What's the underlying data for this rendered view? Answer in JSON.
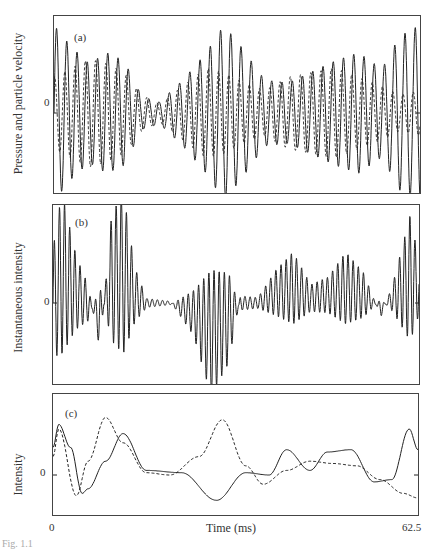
{
  "figure": {
    "panels": [
      {
        "id": "a",
        "tag": "(a)",
        "ylabel": "Pressure and particle velocity",
        "zero_label": "0"
      },
      {
        "id": "b",
        "tag": "(b)",
        "ylabel": "Instantaneous intensity",
        "zero_label": "0"
      },
      {
        "id": "c",
        "tag": "(c)",
        "ylabel": "Intensity",
        "zero_label": "0"
      }
    ],
    "xaxis": {
      "label": "Time (ms)",
      "min_label": "0",
      "max_label": "62.5"
    },
    "caption_fragment": "Fig. 1.1"
  },
  "chart_data": [
    {
      "type": "line",
      "title": "(a)",
      "xlabel": "",
      "ylabel": "Pressure and particle velocity",
      "xlim": [
        0,
        62.5
      ],
      "yticks": [
        "0"
      ],
      "grid": false,
      "series": [
        {
          "name": "pressure",
          "style": "solid",
          "description": "oscillating waveform (~35 cycles over 62.5 ms) with beating amplitude envelope; large excursions near 0-8 ms, 27-33 ms and 57-62 ms, minimum near 15-17 ms"
        },
        {
          "name": "particle velocity",
          "style": "dashed",
          "description": "oscillating waveform of similar frequency, smaller amplitude, out of phase in some segments"
        }
      ]
    },
    {
      "type": "line",
      "title": "(b)",
      "xlabel": "",
      "ylabel": "Instantaneous intensity",
      "xlim": [
        0,
        62.5
      ],
      "yticks": [
        "0"
      ],
      "grid": false,
      "series": [
        {
          "name": "instantaneous intensity",
          "style": "solid",
          "description": "rapid oscillation with bursts: large positive burst near 8-14 ms, flat near 16-20 ms, large negative burst near 25-31 ms, moderate positive bursts near 38-44 ms and 48-54 ms, rising at 60-62 ms"
        }
      ]
    },
    {
      "type": "line",
      "title": "(c)",
      "xlabel": "Time (ms)",
      "ylabel": "Intensity",
      "xlim": [
        0,
        62.5
      ],
      "yticks": [
        "0"
      ],
      "grid": false,
      "series": [
        {
          "name": "active intensity",
          "style": "solid",
          "x": [
            0,
            1,
            3,
            5,
            6,
            9,
            12,
            16,
            22,
            28,
            33,
            37,
            40,
            44,
            47,
            51,
            55,
            58,
            61,
            62.5
          ],
          "y": [
            0.6,
            1.1,
            0.6,
            -0.4,
            -0.3,
            0.3,
            0.9,
            0.1,
            0.05,
            -0.55,
            0.05,
            0.0,
            0.55,
            0.1,
            0.5,
            0.55,
            -0.15,
            -0.1,
            1.0,
            0.55
          ]
        },
        {
          "name": "reactive intensity",
          "style": "dashed",
          "x": [
            0,
            1,
            4,
            6,
            9,
            12,
            16,
            20,
            25,
            29,
            33,
            36,
            40,
            44,
            48,
            52,
            56,
            60,
            62.5
          ],
          "y": [
            0.4,
            1.0,
            -0.45,
            0.3,
            1.25,
            0.7,
            0.05,
            0.0,
            0.4,
            1.2,
            0.2,
            -0.2,
            0.1,
            0.3,
            0.25,
            0.2,
            -0.1,
            -0.4,
            -0.5
          ]
        }
      ]
    }
  ]
}
